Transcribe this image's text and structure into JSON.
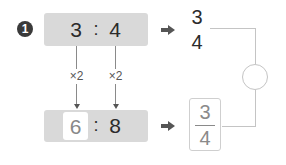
{
  "problem": {
    "number": "1",
    "original_ratio": {
      "antecedent": "3",
      "separator": ":",
      "consequent": "4"
    },
    "multipliers": [
      "×2",
      "×2"
    ],
    "scaled_ratio": {
      "antecedent": "6",
      "separator": ":",
      "consequent": "8"
    },
    "original_fraction": {
      "numerator": "3",
      "denominator": "4"
    },
    "scaled_fraction": {
      "numerator": "3",
      "denominator": "4"
    },
    "comparison_answer": ""
  },
  "colors": {
    "ratio_box": "#d9d9d9",
    "badge": "#3a3a3a",
    "answer_text": "#888888",
    "connector": "#c4c4c4"
  }
}
